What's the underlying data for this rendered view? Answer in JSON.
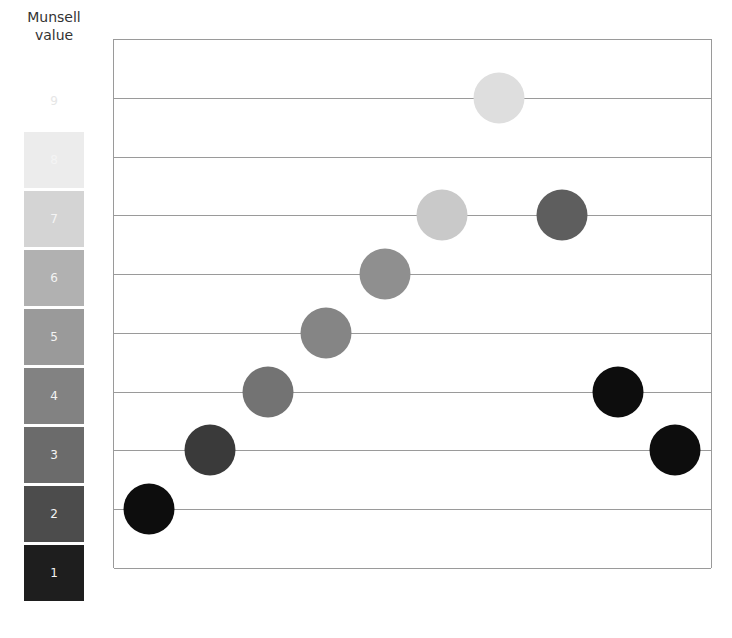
{
  "legend": {
    "title_line1": "Munsell",
    "title_line2": "value",
    "swatches": [
      {
        "label": "9",
        "color": "#ffffff",
        "top": 73
      },
      {
        "label": "8",
        "color": "#ececec",
        "top": 132
      },
      {
        "label": "7",
        "color": "#d4d4d4",
        "top": 191
      },
      {
        "label": "6",
        "color": "#b1b1b1",
        "top": 250
      },
      {
        "label": "5",
        "color": "#9a9a9a",
        "top": 309
      },
      {
        "label": "4",
        "color": "#828282",
        "top": 368
      },
      {
        "label": "3",
        "color": "#6b6b6b",
        "top": 427
      },
      {
        "label": "2",
        "color": "#4c4c4c",
        "top": 486
      },
      {
        "label": "1",
        "color": "#1e1e1e",
        "top": 545
      }
    ]
  },
  "chart_data": {
    "type": "scatter",
    "title": "Munsell value",
    "ylabel": "Munsell value",
    "ylim": [
      1,
      9
    ],
    "grid": true,
    "points": [
      {
        "index": 1,
        "value": 2,
        "color": "#0d0d0d"
      },
      {
        "index": 2,
        "value": 3,
        "color": "#3a3a3a"
      },
      {
        "index": 3,
        "value": 4,
        "color": "#737373"
      },
      {
        "index": 4,
        "value": 5,
        "color": "#858585"
      },
      {
        "index": 5,
        "value": 6,
        "color": "#8f8f8f"
      },
      {
        "index": 6,
        "value": 7,
        "color": "#c9c9c9"
      },
      {
        "index": 7,
        "value": 9,
        "color": "#dedede"
      },
      {
        "index": 8,
        "value": 7,
        "color": "#5e5e5e"
      },
      {
        "index": 9,
        "value": 4,
        "color": "#0d0d0d"
      },
      {
        "index": 10,
        "value": 3,
        "color": "#0d0d0d"
      }
    ]
  }
}
